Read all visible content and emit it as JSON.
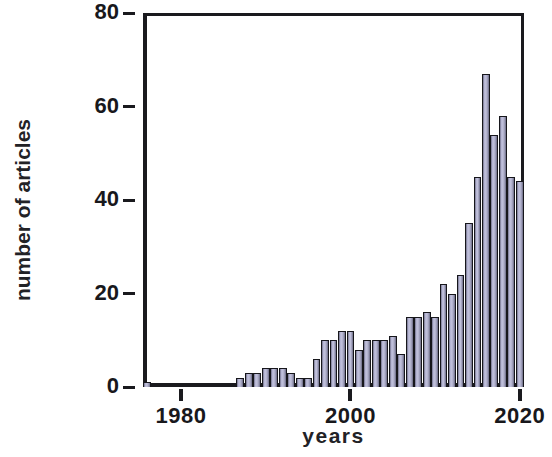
{
  "chart_data": {
    "type": "bar",
    "title": "",
    "subtitle": "",
    "xlabel": "years",
    "ylabel": "number of articles",
    "xlim": [
      1975.5,
      2020.5
    ],
    "ylim": [
      0,
      80
    ],
    "x_ticks": [
      1980,
      2000,
      2020
    ],
    "x_tick_labels": [
      "1980",
      "2000",
      "2020"
    ],
    "y_ticks": [
      0,
      20,
      40,
      60,
      80
    ],
    "y_tick_labels": [
      "0",
      "20",
      "40",
      "60",
      "80"
    ],
    "grid": false,
    "legend": null,
    "bar_fill_color": "#b4b4d2",
    "bar_edge_color": "#17171c",
    "axis_color": "#1a1a1e",
    "background_color": "#ffffff",
    "series": [
      {
        "name": "number of articles",
        "x": [
          1976,
          1977,
          1978,
          1979,
          1980,
          1981,
          1982,
          1983,
          1984,
          1985,
          1986,
          1987,
          1988,
          1989,
          1990,
          1991,
          1992,
          1993,
          1994,
          1995,
          1996,
          1997,
          1998,
          1999,
          2000,
          2001,
          2002,
          2003,
          2004,
          2005,
          2006,
          2007,
          2008,
          2009,
          2010,
          2011,
          2012,
          2013,
          2014,
          2015,
          2016,
          2017,
          2018,
          2019,
          2020
        ],
        "values": [
          1,
          0,
          0,
          0,
          0,
          0,
          0,
          0,
          0,
          0,
          0,
          2,
          3,
          3,
          4,
          4,
          4,
          3,
          2,
          2,
          6,
          10,
          10,
          12,
          12,
          8,
          10,
          10,
          10,
          11,
          7,
          15,
          15,
          16,
          15,
          22,
          20,
          24,
          35,
          45,
          67,
          54,
          58,
          45,
          44
        ]
      }
    ]
  },
  "axes": {
    "y_label": "number of articles",
    "x_label": "years"
  }
}
